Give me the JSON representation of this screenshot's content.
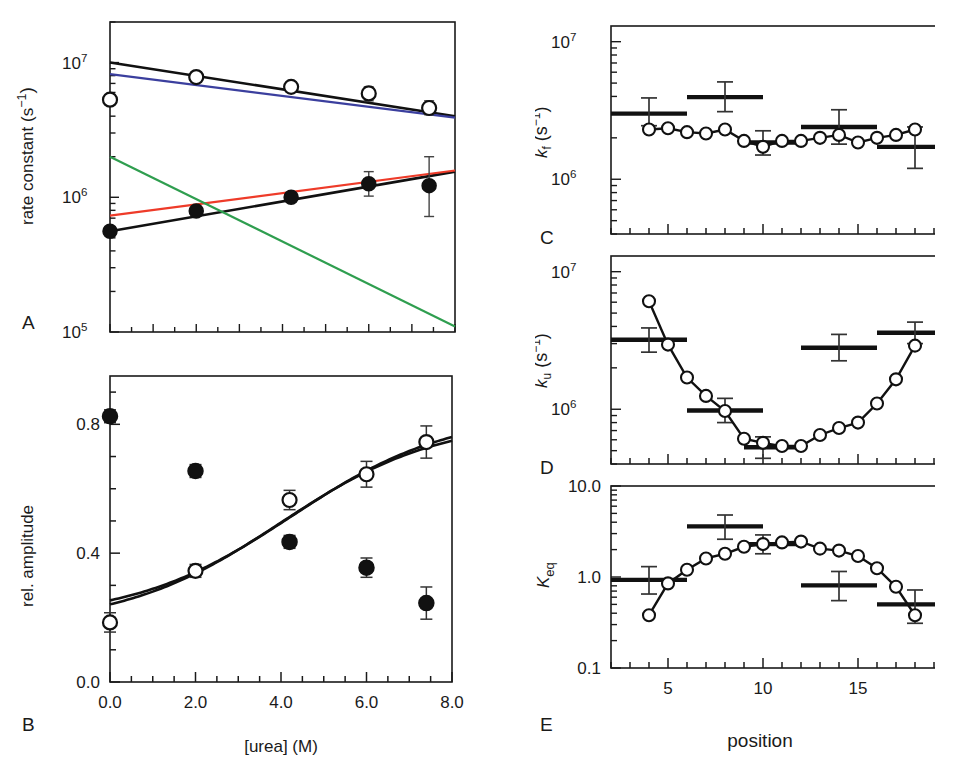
{
  "figure": {
    "panels": [
      "A",
      "B",
      "C",
      "D",
      "E"
    ],
    "label_A": "A",
    "label_B": "B",
    "label_C": "C",
    "label_D": "D",
    "label_E": "E"
  },
  "axis_text": {
    "A_ylabel": "rate constant (s",
    "A_ylabel_sup": "−1",
    "A_ylabel_tail": ")",
    "A_ytick_1": "10",
    "A_ytick_1_sup": "7",
    "A_ytick_2": "10",
    "A_ytick_2_sup": "6",
    "A_ytick_3": "10",
    "A_ytick_3_sup": "5",
    "B_ylabel": "rel. amplitude",
    "B_yticks": [
      "0.8",
      "0.4",
      "0.0"
    ],
    "B_xticks": [
      "0.0",
      "2.0",
      "4.0",
      "6.0",
      "8.0"
    ],
    "B_xlabel": "[urea] (M)",
    "C_ylabel_k": "k",
    "C_ylabel_sub": "f",
    "C_ylabel_rest": " (s",
    "C_ylabel_sup": "−1",
    "C_ylabel_tail": ")",
    "C_yticks": [
      "10",
      "10"
    ],
    "C_ytick_sups": [
      "7",
      "6"
    ],
    "D_ylabel_k": "k",
    "D_ylabel_sub": "u",
    "D_ylabel_rest": " (s",
    "D_ylabel_sup": "−1",
    "D_ylabel_tail": ")",
    "D_yticks": [
      "10",
      "10"
    ],
    "D_ytick_sups": [
      "7",
      "6"
    ],
    "E_ylabel_k": "K",
    "E_ylabel_sub": "eq",
    "E_yticks": [
      "10.0",
      "1.0",
      "0.1"
    ],
    "E_xticks": [
      "5",
      "10",
      "15",
      "20"
    ],
    "E_xlabel": "position"
  },
  "colors": {
    "black": "#111111",
    "blue": "#3b3f9e",
    "red": "#ee3b29",
    "green": "#2f9e4f",
    "axis": "#1a1a1a",
    "errorbar": "#555555"
  },
  "chart_data": [
    {
      "panel": "A",
      "type": "scatter",
      "title": "",
      "xlabel": "[urea] (M)",
      "ylabel": "rate constant (s−1)",
      "xlim": [
        0.0,
        8.0
      ],
      "ylim": [
        100000.0,
        20000000.0
      ],
      "yscale": "log",
      "xscale": "linear",
      "grid": false,
      "legend": "none",
      "series": [
        {
          "name": "observed fast rate (open circles)",
          "marker": "open-circle",
          "x": [
            0.0,
            2.0,
            4.2,
            6.0,
            7.4
          ],
          "y": [
            5300000.0,
            7800000.0,
            6600000.0,
            5900000.0,
            4600000.0
          ],
          "yerr_lo": [
            5300000.0,
            7200000.0,
            6200000.0,
            5200000.0,
            4100000.0
          ],
          "yerr_hi": [
            5300000.0,
            8400000.0,
            7100000.0,
            6600000.0,
            5200000.0
          ]
        },
        {
          "name": "observed slow rate (filled circles)",
          "marker": "filled-circle",
          "x": [
            0.0,
            2.0,
            4.2,
            6.0,
            7.4
          ],
          "y": [
            560000.0,
            790000.0,
            1000000.0,
            1260000.0,
            1220000.0
          ],
          "yerr_lo": [
            560000.0,
            790000.0,
            920000.0,
            1020000.0,
            720000.0
          ],
          "yerr_hi": [
            560000.0,
            790000.0,
            1080000.0,
            1550000.0,
            2000000.0
          ]
        }
      ],
      "fit_lines": [
        {
          "name": "global fit upper (black)",
          "color": "#111111",
          "x": [
            0.0,
            8.0
          ],
          "y": [
            10000000.0,
            4000000.0
          ]
        },
        {
          "name": "model upper (blue)",
          "color": "#3b3f9e",
          "x": [
            0.0,
            8.0
          ],
          "y": [
            8200000.0,
            3900000.0
          ]
        },
        {
          "name": "global fit lower (black)",
          "color": "#111111",
          "x": [
            0.0,
            8.0
          ],
          "y": [
            560000.0,
            1550000.0
          ]
        },
        {
          "name": "model lower (red)",
          "color": "#ee3b29",
          "x": [
            0.0,
            8.0
          ],
          "y": [
            730000.0,
            1580000.0
          ]
        },
        {
          "name": "model decreasing (green)",
          "color": "#2f9e4f",
          "x": [
            0.0,
            8.0
          ],
          "y": [
            2000000.0,
            110000.0
          ]
        }
      ]
    },
    {
      "panel": "B",
      "type": "scatter",
      "title": "",
      "xlabel": "[urea] (M)",
      "ylabel": "rel. amplitude",
      "xlim": [
        0.0,
        8.0
      ],
      "ylim": [
        0.0,
        0.95
      ],
      "grid": false,
      "legend": "none",
      "series": [
        {
          "name": "amplitude decreasing (filled circles)",
          "marker": "filled-circle",
          "x": [
            0.0,
            2.0,
            4.2,
            6.0,
            7.4
          ],
          "y": [
            0.825,
            0.655,
            0.435,
            0.355,
            0.245
          ],
          "yerr_lo": [
            0.805,
            0.635,
            0.415,
            0.325,
            0.195
          ],
          "yerr_hi": [
            0.845,
            0.675,
            0.455,
            0.385,
            0.295
          ]
        },
        {
          "name": "amplitude increasing (open circles)",
          "marker": "open-circle",
          "x": [
            0.0,
            2.0,
            4.2,
            6.0,
            7.4
          ],
          "y": [
            0.185,
            0.345,
            0.565,
            0.645,
            0.745
          ],
          "yerr_lo": [
            0.155,
            0.325,
            0.535,
            0.605,
            0.695
          ],
          "yerr_hi": [
            0.215,
            0.365,
            0.595,
            0.685,
            0.795
          ]
        }
      ],
      "fit_lines": [
        {
          "name": "sigmoid decreasing (black)",
          "color": "#111111"
        },
        {
          "name": "sigmoid increasing (black)",
          "color": "#111111"
        }
      ]
    },
    {
      "panel": "C",
      "type": "line",
      "title": "",
      "xlabel": "position",
      "ylabel": "k_f (s−1)",
      "xlim": [
        2,
        20
      ],
      "ylim": [
        400000.0,
        13000000.0
      ],
      "yscale": "log",
      "grid": false,
      "legend": "none",
      "x": [
        4,
        5,
        6,
        7,
        8,
        9,
        10,
        11,
        12,
        13,
        14,
        15,
        16,
        17,
        18
      ],
      "values": [
        2300000.0,
        2350000.0,
        2200000.0,
        2150000.0,
        2300000.0,
        1900000.0,
        1720000.0,
        1900000.0,
        1900000.0,
        2000000.0,
        2100000.0,
        1850000.0,
        2000000.0,
        2100000.0,
        2300000.0,
        2450000.0
      ],
      "bars": [
        {
          "x_start": 2.0,
          "x_end": 6.0,
          "value": 3000000.0,
          "err_lo": 2450000.0,
          "err_hi": 3900000.0,
          "center_x": 4.0
        },
        {
          "x_start": 6.0,
          "x_end": 10.0,
          "value": 3950000.0,
          "err_lo": 3100000.0,
          "err_hi": 5100000.0,
          "center_x": 8.0
        },
        {
          "x_start": 9.0,
          "x_end": 12.0,
          "value": 1850000.0,
          "err_lo": 1500000.0,
          "err_hi": 2250000.0,
          "center_x": 10.0
        },
        {
          "x_start": 12.0,
          "x_end": 16.0,
          "value": 2400000.0,
          "err_lo": 1800000.0,
          "err_hi": 3200000.0,
          "center_x": 14.0
        },
        {
          "x_start": 16.0,
          "x_end": 20.0,
          "value": 1720000.0,
          "err_lo": 1200000.0,
          "err_hi": 2400000.0,
          "center_x": 18.0
        }
      ]
    },
    {
      "panel": "D",
      "type": "line",
      "title": "",
      "xlabel": "position",
      "ylabel": "k_u (s−1)",
      "xlim": [
        2,
        20
      ],
      "ylim": [
        400000.0,
        13000000.0
      ],
      "yscale": "log",
      "grid": false,
      "legend": "none",
      "x": [
        4,
        5,
        6,
        7,
        8,
        9,
        10,
        11,
        12,
        13,
        14,
        15,
        16,
        17,
        18
      ],
      "values": [
        6100000.0,
        2950000.0,
        1700000.0,
        1250000.0,
        970000.0,
        610000.0,
        570000.0,
        540000.0,
        540000.0,
        650000.0,
        730000.0,
        800000.0,
        1100000.0,
        1650000.0,
        2900000.0,
        6100000.0
      ],
      "bars": [
        {
          "x_start": 2.0,
          "x_end": 6.0,
          "value": 3200000.0,
          "err_lo": 2600000.0,
          "err_hi": 3900000.0,
          "center_x": 4.0
        },
        {
          "x_start": 6.0,
          "x_end": 10.0,
          "value": 980000.0,
          "err_lo": 800000.0,
          "err_hi": 1200000.0,
          "center_x": 8.0
        },
        {
          "x_start": 9.0,
          "x_end": 12.0,
          "value": 530000.0,
          "err_lo": 440000.0,
          "err_hi": 630000.0,
          "center_x": 10.0
        },
        {
          "x_start": 12.0,
          "x_end": 16.0,
          "value": 2800000.0,
          "err_lo": 2250000.0,
          "err_hi": 3500000.0,
          "center_x": 14.0
        },
        {
          "x_start": 16.0,
          "x_end": 20.0,
          "value": 3600000.0,
          "err_lo": 3000000.0,
          "err_hi": 4300000.0,
          "center_x": 18.0
        }
      ]
    },
    {
      "panel": "E",
      "type": "line",
      "title": "",
      "xlabel": "position",
      "ylabel": "K_eq",
      "xlim": [
        2,
        20
      ],
      "ylim": [
        0.1,
        10.0
      ],
      "yscale": "log",
      "grid": false,
      "legend": "none",
      "x": [
        4,
        5,
        6,
        7,
        8,
        9,
        10,
        11,
        12,
        13,
        14,
        15,
        16,
        17,
        18
      ],
      "values": [
        0.38,
        0.85,
        1.2,
        1.6,
        1.8,
        2.15,
        2.3,
        2.4,
        2.45,
        2.05,
        1.95,
        1.7,
        1.25,
        0.78,
        0.38
      ],
      "bars": [
        {
          "x_start": 2.0,
          "x_end": 6.0,
          "value": 0.93,
          "err_lo": 0.65,
          "err_hi": 1.3,
          "center_x": 4.0
        },
        {
          "x_start": 6.0,
          "x_end": 10.0,
          "value": 3.6,
          "err_lo": 2.6,
          "err_hi": 4.8,
          "center_x": 8.0
        },
        {
          "x_start": 9.0,
          "x_end": 12.0,
          "value": 2.3,
          "err_lo": 1.8,
          "err_hi": 2.9,
          "center_x": 10.0
        },
        {
          "x_start": 12.0,
          "x_end": 16.0,
          "value": 0.81,
          "err_lo": 0.55,
          "err_hi": 1.15,
          "center_x": 14.0
        },
        {
          "x_start": 16.0,
          "x_end": 20.0,
          "value": 0.5,
          "err_lo": 0.31,
          "err_hi": 0.72,
          "center_x": 18.0
        }
      ]
    }
  ]
}
